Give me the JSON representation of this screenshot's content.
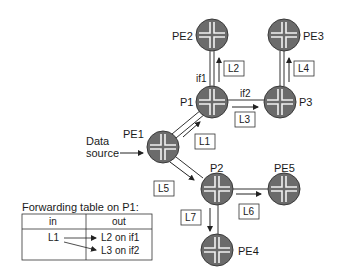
{
  "diagram": {
    "type": "network-multicast-p2mp-lsp",
    "routers": [
      {
        "id": "PE2",
        "label": "PE2",
        "x": 212,
        "y": 35
      },
      {
        "id": "PE3",
        "label": "PE3",
        "x": 284,
        "y": 35
      },
      {
        "id": "P1",
        "label": "P1",
        "x": 212,
        "y": 102
      },
      {
        "id": "P3",
        "label": "P3",
        "x": 280,
        "y": 102
      },
      {
        "id": "PE1",
        "label": "PE1",
        "x": 163,
        "y": 147
      },
      {
        "id": "P2",
        "label": "P2",
        "x": 217,
        "y": 189
      },
      {
        "id": "PE5",
        "label": "PE5",
        "x": 284,
        "y": 189
      },
      {
        "id": "PE4",
        "label": "PE4",
        "x": 217,
        "y": 250
      }
    ],
    "links": [
      {
        "from": "PE1",
        "to": "P1",
        "label": "L1"
      },
      {
        "from": "P1",
        "to": "PE2",
        "label": "L2",
        "interface": "if1"
      },
      {
        "from": "P1",
        "to": "P3",
        "label": "L3",
        "interface": "if2"
      },
      {
        "from": "P3",
        "to": "PE3",
        "label": "L4"
      },
      {
        "from": "PE1",
        "to": "P2",
        "label": "L5"
      },
      {
        "from": "P2",
        "to": "PE5",
        "label": "L6"
      },
      {
        "from": "P2",
        "to": "PE4",
        "label": "L7"
      }
    ],
    "source": {
      "line1": "Data",
      "line2": "source"
    },
    "interfaces": {
      "if1": "if1",
      "if2": "if2"
    },
    "label_boxes": {
      "L1": "L1",
      "L2": "L2",
      "L3": "L3",
      "L4": "L4",
      "L5": "L5",
      "L6": "L6",
      "L7": "L7"
    }
  },
  "forwarding_table": {
    "title": "Forwarding table on P1:",
    "headers": {
      "in": "in",
      "out": "out"
    },
    "rows": [
      {
        "in": "L1",
        "out": [
          "L2 on if1",
          "L3 on if2"
        ]
      }
    ]
  },
  "colors": {
    "router_fill": "#6b6b6b",
    "router_edge": "#3a3a3a",
    "line": "#333333",
    "text": "#1a1a1a"
  }
}
